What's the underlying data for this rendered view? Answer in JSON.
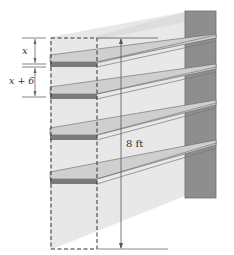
{
  "diagram": {
    "type": "bookshelf-dimension-diagram",
    "shelf_count": 4,
    "labels": {
      "top_gap": "x",
      "second_gap": "x + 6",
      "total_height": "8 ft"
    },
    "colors": {
      "background_wall": "#e6e6e6",
      "side_panel": "#8f8f8f",
      "shelf_top": "#c4c4c4",
      "shelf_front": "#7a7a7a",
      "lines": "#555555",
      "dimension_lines": "#777777"
    }
  }
}
